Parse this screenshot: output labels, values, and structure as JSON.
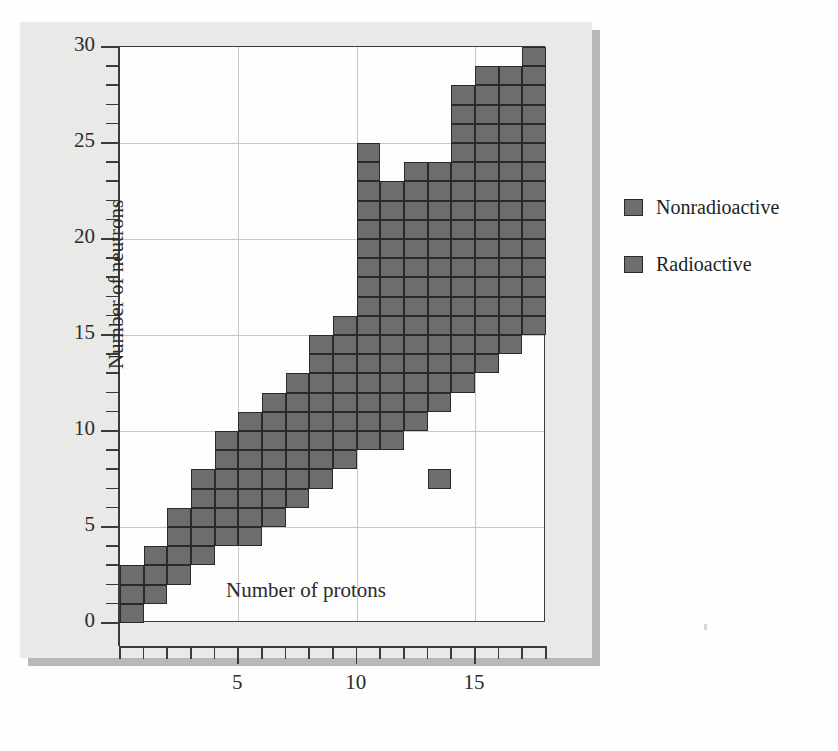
{
  "figure": {
    "axes": {
      "x_title": "Number of protons",
      "y_title": "Number of neutrons",
      "x_major_labels": [
        "5",
        "10",
        "15"
      ],
      "y_major_labels": [
        "0",
        "5",
        "10",
        "15",
        "20",
        "25",
        "30"
      ]
    },
    "legend": {
      "items": [
        {
          "label": "Nonradioactive",
          "color": "#6d6d6d",
          "swatch_name": "legend-swatch-nonradioactive"
        },
        {
          "label": "Radioactive",
          "color": "#6d6d6d",
          "swatch_name": "legend-swatch-radioactive"
        }
      ]
    },
    "ghost_text": {
      "line1": "ntion  band  of  stability",
      "line2": "e  for  hydrogen"
    }
  },
  "chart_data": {
    "type": "heatmap",
    "title": "",
    "subtitle": "",
    "xlabel": "Number of protons",
    "ylabel": "Number of neutrons",
    "xlim": [
      0,
      18
    ],
    "ylim": [
      0,
      30
    ],
    "x_ticks": [
      0,
      1,
      2,
      3,
      4,
      5,
      6,
      7,
      8,
      9,
      10,
      11,
      12,
      13,
      14,
      15,
      16,
      17,
      18
    ],
    "x_tick_labels": [
      "",
      "",
      "",
      "",
      "",
      "5",
      "",
      "",
      "",
      "",
      "10",
      "",
      "",
      "",
      "",
      "15",
      "",
      "",
      ""
    ],
    "y_ticks": [
      0,
      1,
      2,
      3,
      4,
      5,
      6,
      7,
      8,
      9,
      10,
      11,
      12,
      13,
      14,
      15,
      16,
      17,
      18,
      19,
      20,
      21,
      22,
      23,
      24,
      25,
      26,
      27,
      28,
      29,
      30
    ],
    "y_tick_labels": [
      "0",
      "",
      "",
      "",
      "",
      "5",
      "",
      "",
      "",
      "",
      "10",
      "",
      "",
      "",
      "",
      "15",
      "",
      "",
      "",
      "",
      "20",
      "",
      "",
      "",
      "",
      "25",
      "",
      "",
      "",
      "",
      "30"
    ],
    "grid": true,
    "grid_x_at": [
      5,
      10,
      15
    ],
    "grid_y_at": [
      5,
      10,
      15,
      20,
      25
    ],
    "cell_color": "#6d6d6d",
    "cell_border_color": "#2a2a2a",
    "legend_position": "right-outside",
    "legend_entries": [
      "Nonradioactive",
      "Radioactive"
    ],
    "columns": [
      {
        "protons": 1,
        "neutron_min": 0,
        "neutron_max": 2
      },
      {
        "protons": 2,
        "neutron_min": 1,
        "neutron_max": 3
      },
      {
        "protons": 3,
        "neutron_min": 2,
        "neutron_max": 5
      },
      {
        "protons": 4,
        "neutron_min": 3,
        "neutron_max": 7
      },
      {
        "protons": 5,
        "neutron_min": 4,
        "neutron_max": 9
      },
      {
        "protons": 6,
        "neutron_min": 4,
        "neutron_max": 10
      },
      {
        "protons": 7,
        "neutron_min": 5,
        "neutron_max": 11
      },
      {
        "protons": 8,
        "neutron_min": 6,
        "neutron_max": 12
      },
      {
        "protons": 9,
        "neutron_min": 7,
        "neutron_max": 14
      },
      {
        "protons": 10,
        "neutron_min": 8,
        "neutron_max": 15
      },
      {
        "protons": 11,
        "neutron_min": 9,
        "neutron_max": 16
      },
      {
        "protons": 12,
        "neutron_min": 9,
        "neutron_max": 18
      },
      {
        "protons": 13,
        "neutron_min": 10,
        "neutron_max": 18
      },
      {
        "protons": 14,
        "neutron_min": 11,
        "neutron_max": 20
      },
      {
        "protons": 15,
        "neutron_min": 12,
        "neutron_max": 21
      },
      {
        "protons": 16,
        "neutron_min": 13,
        "neutron_max": 23
      },
      {
        "protons": 17,
        "neutron_min": 14,
        "neutron_max": 24
      },
      {
        "protons": 18,
        "neutron_min": 15,
        "neutron_max": 26
      }
    ],
    "cells": [
      [
        1,
        0
      ],
      [
        1,
        1
      ],
      [
        1,
        2
      ],
      [
        2,
        1
      ],
      [
        2,
        2
      ],
      [
        2,
        3
      ],
      [
        3,
        2
      ],
      [
        3,
        3
      ],
      [
        3,
        4
      ],
      [
        3,
        5
      ],
      [
        4,
        3
      ],
      [
        4,
        4
      ],
      [
        4,
        5
      ],
      [
        4,
        6
      ],
      [
        4,
        7
      ],
      [
        5,
        4
      ],
      [
        5,
        5
      ],
      [
        5,
        6
      ],
      [
        5,
        7
      ],
      [
        5,
        8
      ],
      [
        5,
        9
      ],
      [
        6,
        4
      ],
      [
        6,
        5
      ],
      [
        6,
        6
      ],
      [
        6,
        7
      ],
      [
        6,
        8
      ],
      [
        6,
        9
      ],
      [
        6,
        10
      ],
      [
        7,
        5
      ],
      [
        7,
        6
      ],
      [
        7,
        7
      ],
      [
        7,
        8
      ],
      [
        7,
        9
      ],
      [
        7,
        10
      ],
      [
        7,
        11
      ],
      [
        8,
        6
      ],
      [
        8,
        7
      ],
      [
        8,
        8
      ],
      [
        8,
        9
      ],
      [
        8,
        10
      ],
      [
        8,
        11
      ],
      [
        8,
        12
      ],
      [
        9,
        7
      ],
      [
        9,
        8
      ],
      [
        9,
        9
      ],
      [
        9,
        10
      ],
      [
        9,
        11
      ],
      [
        9,
        12
      ],
      [
        9,
        13
      ],
      [
        9,
        14
      ],
      [
        10,
        8
      ],
      [
        10,
        9
      ],
      [
        10,
        10
      ],
      [
        10,
        11
      ],
      [
        10,
        12
      ],
      [
        10,
        13
      ],
      [
        10,
        14
      ],
      [
        10,
        15
      ],
      [
        11,
        9
      ],
      [
        11,
        10
      ],
      [
        11,
        11
      ],
      [
        11,
        12
      ],
      [
        11,
        13
      ],
      [
        11,
        14
      ],
      [
        11,
        15
      ],
      [
        11,
        16
      ],
      [
        11,
        17
      ],
      [
        11,
        18
      ],
      [
        11,
        19
      ],
      [
        11,
        20
      ],
      [
        11,
        21
      ],
      [
        11,
        22
      ],
      [
        11,
        23
      ],
      [
        11,
        24
      ],
      [
        12,
        9
      ],
      [
        12,
        10
      ],
      [
        12,
        11
      ],
      [
        12,
        12
      ],
      [
        12,
        13
      ],
      [
        12,
        14
      ],
      [
        12,
        15
      ],
      [
        12,
        16
      ],
      [
        12,
        17
      ],
      [
        12,
        18
      ],
      [
        12,
        19
      ],
      [
        12,
        20
      ],
      [
        12,
        21
      ],
      [
        12,
        22
      ],
      [
        13,
        10
      ],
      [
        13,
        11
      ],
      [
        13,
        12
      ],
      [
        13,
        13
      ],
      [
        13,
        14
      ],
      [
        13,
        15
      ],
      [
        13,
        16
      ],
      [
        13,
        17
      ],
      [
        13,
        18
      ],
      [
        13,
        19
      ],
      [
        13,
        20
      ],
      [
        13,
        21
      ],
      [
        13,
        22
      ],
      [
        13,
        23
      ],
      [
        14,
        7
      ],
      [
        14,
        11
      ],
      [
        14,
        12
      ],
      [
        14,
        13
      ],
      [
        14,
        14
      ],
      [
        14,
        15
      ],
      [
        14,
        16
      ],
      [
        14,
        17
      ],
      [
        14,
        18
      ],
      [
        14,
        19
      ],
      [
        14,
        20
      ],
      [
        14,
        21
      ],
      [
        14,
        22
      ],
      [
        14,
        23
      ],
      [
        15,
        12
      ],
      [
        15,
        13
      ],
      [
        15,
        14
      ],
      [
        15,
        15
      ],
      [
        15,
        16
      ],
      [
        15,
        17
      ],
      [
        15,
        18
      ],
      [
        15,
        19
      ],
      [
        15,
        20
      ],
      [
        15,
        21
      ],
      [
        15,
        22
      ],
      [
        15,
        23
      ],
      [
        15,
        24
      ],
      [
        15,
        25
      ],
      [
        15,
        26
      ],
      [
        15,
        27
      ],
      [
        16,
        13
      ],
      [
        16,
        14
      ],
      [
        16,
        15
      ],
      [
        16,
        16
      ],
      [
        16,
        17
      ],
      [
        16,
        18
      ],
      [
        16,
        19
      ],
      [
        16,
        20
      ],
      [
        16,
        21
      ],
      [
        16,
        22
      ],
      [
        16,
        23
      ],
      [
        16,
        24
      ],
      [
        16,
        25
      ],
      [
        16,
        26
      ],
      [
        16,
        27
      ],
      [
        16,
        28
      ],
      [
        17,
        14
      ],
      [
        17,
        15
      ],
      [
        17,
        16
      ],
      [
        17,
        17
      ],
      [
        17,
        18
      ],
      [
        17,
        19
      ],
      [
        17,
        20
      ],
      [
        17,
        21
      ],
      [
        17,
        22
      ],
      [
        17,
        23
      ],
      [
        17,
        24
      ],
      [
        17,
        25
      ],
      [
        17,
        26
      ],
      [
        17,
        27
      ],
      [
        17,
        28
      ],
      [
        18,
        15
      ],
      [
        18,
        16
      ],
      [
        18,
        17
      ],
      [
        18,
        18
      ],
      [
        18,
        19
      ],
      [
        18,
        20
      ],
      [
        18,
        21
      ],
      [
        18,
        22
      ],
      [
        18,
        23
      ],
      [
        18,
        24
      ],
      [
        18,
        25
      ],
      [
        18,
        26
      ],
      [
        18,
        27
      ],
      [
        18,
        28
      ],
      [
        18,
        29
      ]
    ]
  }
}
